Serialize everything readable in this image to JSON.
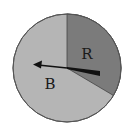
{
  "diagram": {
    "type": "spinner",
    "sections": [
      {
        "label": "R",
        "fill": "#7b7b7b",
        "fraction": 0.33
      },
      {
        "label": "B",
        "fill": "#b5b5b5",
        "fraction": 0.67
      }
    ],
    "arrow": {
      "pointing_to": "B",
      "color": "#111111"
    },
    "colors": {
      "outline": "#555555",
      "background": "#ffffff"
    }
  }
}
